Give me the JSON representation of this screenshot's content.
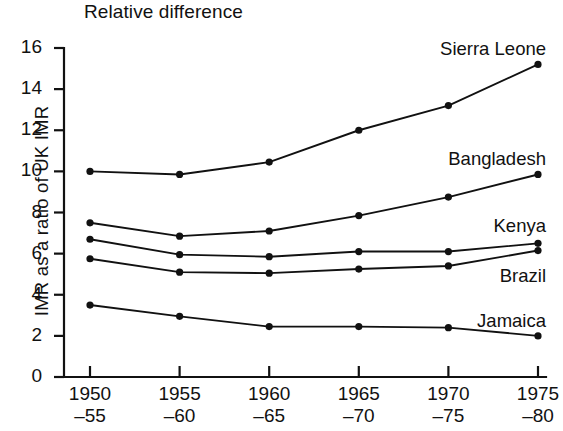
{
  "chart_data": {
    "type": "line",
    "title": "Relative difference",
    "xlabel": "",
    "ylabel": "IMR as a ratio of UK IMR",
    "categories": [
      "1950\n-55",
      "1955\n-60",
      "1960\n-65",
      "1965\n-70",
      "1970\n-75",
      "1975\n-80"
    ],
    "x_tick_labels": [
      {
        "line1": "1950",
        "line2": "–55"
      },
      {
        "line1": "1955",
        "line2": "–60"
      },
      {
        "line1": "1960",
        "line2": "–65"
      },
      {
        "line1": "1965",
        "line2": "–70"
      },
      {
        "line1": "1970",
        "line2": "–75"
      },
      {
        "line1": "1975",
        "line2": "–80"
      }
    ],
    "y_tick_labels": [
      "16",
      "14",
      "12",
      "10",
      "8",
      "6",
      "4",
      "2",
      "0"
    ],
    "y_ticks": [
      16,
      14,
      12,
      10,
      8,
      6,
      4,
      2,
      0
    ],
    "ylim": [
      0,
      16
    ],
    "grid": false,
    "legend_position": "inline-right",
    "series": [
      {
        "name": "Sierra Leone",
        "values": [
          10.0,
          9.85,
          10.45,
          12.0,
          13.2,
          15.2
        ],
        "color": "#111111"
      },
      {
        "name": "Bangladesh",
        "values": [
          7.5,
          6.85,
          7.1,
          7.85,
          8.75,
          9.85
        ],
        "color": "#111111"
      },
      {
        "name": "Kenya",
        "values": [
          6.7,
          5.95,
          5.85,
          6.1,
          6.1,
          6.5
        ],
        "color": "#111111"
      },
      {
        "name": "Brazil",
        "values": [
          5.75,
          5.1,
          5.05,
          5.25,
          5.4,
          6.15
        ],
        "color": "#111111"
      },
      {
        "name": "Jamaica",
        "values": [
          3.5,
          2.95,
          2.45,
          2.45,
          2.4,
          2.0
        ],
        "color": "#111111"
      }
    ],
    "series_label_offsets": [
      {
        "name": "Sierra Leone",
        "dx": 8,
        "dy": -26
      },
      {
        "name": "Bangladesh",
        "dx": 8,
        "dy": -26
      },
      {
        "name": "Kenya",
        "dx": 8,
        "dy": -28
      },
      {
        "name": "Brazil",
        "dx": 8,
        "dy": 14
      },
      {
        "name": "Jamaica",
        "dx": 8,
        "dy": -26
      }
    ],
    "colors": {
      "ink": "#111111",
      "background": "#ffffff"
    }
  }
}
